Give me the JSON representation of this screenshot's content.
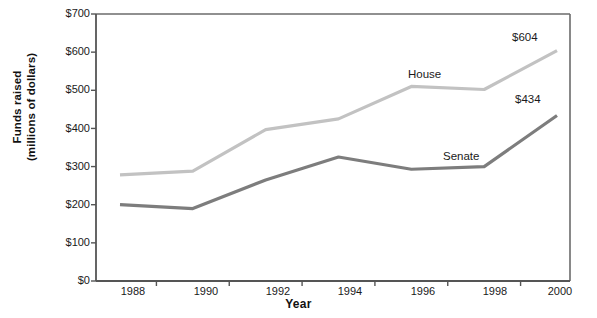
{
  "chart_data": {
    "type": "line",
    "title": "",
    "xlabel": "Year",
    "ylabel": "Funds raised (millions of dollars)",
    "ylabel_line1": "Funds raised",
    "ylabel_line2": "(millions of dollars)",
    "categories": [
      "1988",
      "1990",
      "1992",
      "1994",
      "1996",
      "1998",
      "2000"
    ],
    "x": [
      1988,
      1990,
      1992,
      1994,
      1996,
      1998,
      2000
    ],
    "ylim": [
      0,
      700
    ],
    "ytick_values": [
      0,
      100,
      200,
      300,
      400,
      500,
      600,
      700
    ],
    "ytick_labels": [
      "$0",
      "$100",
      "$200",
      "$300",
      "$400",
      "$500",
      "$600",
      "$700"
    ],
    "grid": false,
    "legend_position": "inline-series-labels",
    "series": [
      {
        "name": "House",
        "color": "#c2c2c2",
        "values": [
          278,
          288,
          397,
          425,
          510,
          502,
          604
        ],
        "inline_label": "House",
        "end_value_label": "$604"
      },
      {
        "name": "Senate",
        "color": "#7d7d7d",
        "values": [
          200,
          190,
          265,
          325,
          293,
          300,
          434
        ],
        "inline_label": "Senate",
        "end_value_label": "$434"
      }
    ],
    "annotations": [
      {
        "text": "House",
        "series": "House"
      },
      {
        "text": "$604",
        "series": "House"
      },
      {
        "text": "Senate",
        "series": "Senate"
      },
      {
        "text": "$434",
        "series": "Senate"
      }
    ]
  },
  "axis_style": {
    "axis_color": "#555555",
    "frame_color": "#6b6b6b",
    "background": "#ffffff"
  }
}
